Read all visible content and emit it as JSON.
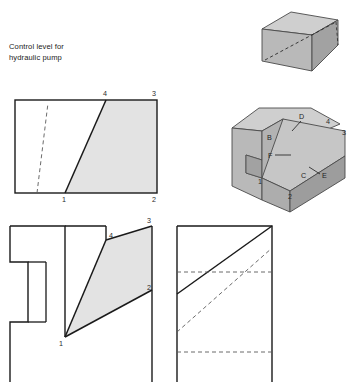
{
  "drawing": {
    "title_note": "Control level for\nhydraulic pump",
    "background_color": "#ffffff",
    "line_color": "#1a1a1a",
    "shade_color": "#e3e3e3",
    "solid_gray": "#b9b9b9",
    "solid_gray_light": "#cfcfcf",
    "solid_gray_dark": "#a2a2a2",
    "dash_color": "#5a5a5a"
  },
  "views": {
    "top_left": {
      "name": "top-view-rectangle",
      "vertex_labels": [
        "4",
        "3",
        "1",
        "2"
      ],
      "label_4": "4",
      "label_3": "3",
      "label_1": "1",
      "label_2": "2"
    },
    "bottom_left": {
      "name": "front-view-with-notch",
      "label_4": "4",
      "label_3": "3",
      "label_1": "1",
      "label_2": "2"
    },
    "bottom_right": {
      "name": "side-view-with-hidden-lines"
    },
    "iso_top": {
      "name": "isometric-wedge-upper"
    },
    "iso_bottom": {
      "name": "isometric-block-lower",
      "label_B": "B",
      "label_C": "C",
      "label_D": "D",
      "label_E": "E",
      "label_F": "F",
      "label_1": "1",
      "label_2": "2",
      "label_3": "3",
      "label_4": "4"
    }
  }
}
